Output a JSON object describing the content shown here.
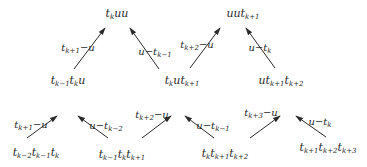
{
  "diagram": {
    "type": "tree-of-rewrites",
    "nodes": [
      {
        "id": "top1",
        "parts": [
          [
            "t",
            "k"
          ],
          [
            "uu",
            ""
          ]
        ],
        "x": 117,
        "y": 13
      },
      {
        "id": "top2",
        "parts": [
          [
            "uut",
            "k+1"
          ]
        ],
        "x": 243,
        "y": 13
      },
      {
        "id": "mid1",
        "parts": [
          [
            "t",
            "k−1"
          ],
          [
            "t",
            "k"
          ],
          [
            "u",
            ""
          ]
        ],
        "x": 68,
        "y": 80
      },
      {
        "id": "mid2",
        "parts": [
          [
            "t",
            "k"
          ],
          [
            "ut",
            "k+1"
          ]
        ],
        "x": 182,
        "y": 80
      },
      {
        "id": "mid3",
        "parts": [
          [
            "ut",
            "k+1"
          ],
          [
            "t",
            "k+2"
          ]
        ],
        "x": 281,
        "y": 80
      },
      {
        "id": "bot1",
        "parts": [
          [
            "t",
            "k−2"
          ],
          [
            "t",
            "k−1"
          ],
          [
            "t",
            "k"
          ]
        ],
        "x": 36,
        "y": 152
      },
      {
        "id": "bot2",
        "parts": [
          [
            "t",
            "k−1"
          ],
          [
            "t",
            "k"
          ],
          [
            "t",
            "k+1"
          ]
        ],
        "x": 122,
        "y": 154
      },
      {
        "id": "bot3",
        "parts": [
          [
            "t",
            "k"
          ],
          [
            "t",
            "k+1"
          ],
          [
            "t",
            "k+2"
          ]
        ],
        "x": 225,
        "y": 153
      },
      {
        "id": "bot4",
        "parts": [
          [
            "t",
            "k+1"
          ],
          [
            "t",
            "k+2"
          ],
          [
            "t",
            "k+3"
          ]
        ],
        "x": 328,
        "y": 147
      }
    ],
    "edges": [
      {
        "from": "mid1",
        "to": "top1",
        "x1": 74,
        "y1": 69,
        "x2": 105,
        "y2": 28,
        "label": [
          [
            "t",
            "k+1"
          ],
          [
            "−u",
            ""
          ]
        ],
        "lx": 78,
        "ly": 47
      },
      {
        "from": "mid2",
        "to": "top1",
        "x1": 159,
        "y1": 69,
        "x2": 130,
        "y2": 28,
        "label": [
          [
            "u−t",
            "k−1"
          ]
        ],
        "lx": 155,
        "ly": 51
      },
      {
        "from": "mid2",
        "to": "top2",
        "x1": 190,
        "y1": 68,
        "x2": 220,
        "y2": 28,
        "label": [
          [
            "t",
            "k+2"
          ],
          [
            "−u",
            ""
          ]
        ],
        "lx": 197,
        "ly": 44
      },
      {
        "from": "mid3",
        "to": "top2",
        "x1": 275,
        "y1": 68,
        "x2": 246,
        "y2": 28,
        "label": [
          [
            "u−t",
            "k"
          ]
        ],
        "lx": 260,
        "ly": 47
      },
      {
        "from": "bot1",
        "to": "mid1",
        "x1": 27,
        "y1": 138,
        "x2": 57,
        "y2": 116,
        "label": [
          [
            "t",
            "k+1"
          ],
          [
            "−u",
            ""
          ]
        ],
        "lx": 31,
        "ly": 124
      },
      {
        "from": "bot2",
        "to": "mid1",
        "x1": 108,
        "y1": 138,
        "x2": 78,
        "y2": 116,
        "label": [
          [
            "u−t",
            "k−2"
          ]
        ],
        "lx": 106,
        "ly": 125
      },
      {
        "from": "bot2",
        "to": "mid2",
        "x1": 142,
        "y1": 138,
        "x2": 171,
        "y2": 116,
        "label": [
          [
            "t",
            "k+2"
          ],
          [
            "−u",
            ""
          ]
        ],
        "lx": 152,
        "ly": 114
      },
      {
        "from": "bot3",
        "to": "mid2",
        "x1": 214,
        "y1": 138,
        "x2": 185,
        "y2": 116,
        "label": [
          [
            "u−t",
            "k−1"
          ]
        ],
        "lx": 213,
        "ly": 125
      },
      {
        "from": "bot3",
        "to": "mid3",
        "x1": 250,
        "y1": 138,
        "x2": 280,
        "y2": 116,
        "label": [
          [
            "t",
            "k+3"
          ],
          [
            "−u",
            ""
          ]
        ],
        "lx": 261,
        "ly": 112
      },
      {
        "from": "bot4",
        "to": "mid3",
        "x1": 326,
        "y1": 137,
        "x2": 296,
        "y2": 116,
        "label": [
          [
            "u−t",
            "k"
          ]
        ],
        "lx": 320,
        "ly": 121
      }
    ]
  },
  "colors": {
    "stroke": "#2a2a2a",
    "background": "#ffffff"
  }
}
